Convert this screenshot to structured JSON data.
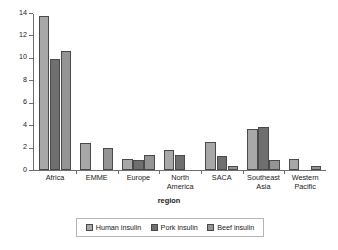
{
  "chart_data": {
    "type": "bar",
    "title": "",
    "xlabel": "region",
    "ylabel": "cost of insulin (US $)",
    "ylim": [
      0,
      14
    ],
    "yticks": [
      0,
      2,
      4,
      6,
      8,
      10,
      12,
      14
    ],
    "grid": false,
    "legend_position": "bottom",
    "categories": [
      "Africa",
      "EMME",
      "Europe",
      "North America",
      "SACA",
      "Southeast Asia",
      "Western Pacific"
    ],
    "series": [
      {
        "name": "Human insulin",
        "color": "#a8a8a8",
        "values": [
          13.7,
          2.35,
          1.0,
          1.8,
          2.45,
          3.65,
          1.0
        ]
      },
      {
        "name": "Pork insulin",
        "color": "#6f6f6f",
        "values": [
          9.9,
          0,
          0.9,
          1.3,
          1.25,
          3.85,
          0
        ]
      },
      {
        "name": "Beef insulin",
        "color": "#949494",
        "values": [
          10.6,
          1.95,
          1.3,
          0,
          0.35,
          0.85,
          0.3
        ]
      }
    ]
  },
  "legend": {
    "items": [
      {
        "label": "Human insulin",
        "key": "human"
      },
      {
        "label": "Pork insulin",
        "key": "pork"
      },
      {
        "label": "Beef insulin",
        "key": "beef"
      }
    ]
  },
  "axis": {
    "y_title": "cost of insulin (US $)",
    "x_title": "region"
  },
  "colors": {
    "human": "#a8a8a8",
    "pork": "#6f6f6f",
    "beef": "#949494",
    "axis": "#6e6e6e",
    "bar_outline": "#4a4a4a",
    "legend_border": "#b5b5b5"
  }
}
